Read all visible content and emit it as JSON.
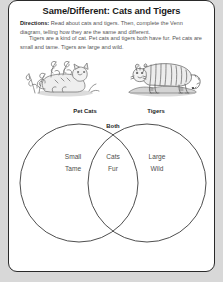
{
  "worksheet": {
    "title": "Same/Different: Cats and Tigers",
    "directions_label": "Directions:",
    "directions_text": " Read about cats and tigers. Then, complete the Venn diagram, telling how they are the same and different.",
    "passage": "Tigers are a kind of cat. Pet cats and tigers both have fur. Pet cats are small and tame. Tigers are large and wild.",
    "illustrations": [
      {
        "name": "cat-illustration",
        "caption": "cat lying among plants"
      },
      {
        "name": "tiger-illustration",
        "caption": "tiger standing on ground"
      }
    ],
    "venn": {
      "left_label": "Pet Cats",
      "right_label": "Tigers",
      "center_label": "Both",
      "left_items": "Small\nTame",
      "center_items": "Cats\nFur",
      "right_items": "Large\nWild"
    },
    "colors": {
      "page_background": "#ffffff",
      "outer_background": "#d8d8d8",
      "border": "#2a2a2a",
      "title_text": "#1a1a1a",
      "body_text": "#555555",
      "venn_stroke": "#3a3a3a",
      "venn_word_text": "#4e4e4e"
    }
  }
}
